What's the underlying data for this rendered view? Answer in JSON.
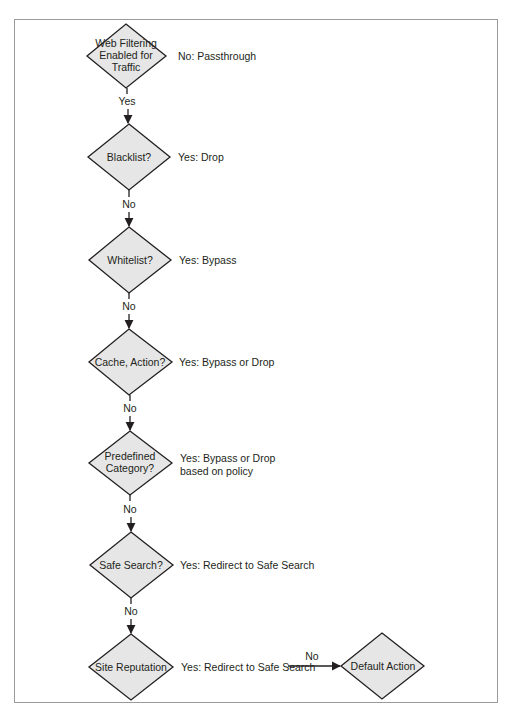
{
  "diagram": {
    "type": "flowchart",
    "colors": {
      "node_fill": "#e6e6e6",
      "stroke": "#231f20",
      "text": "#231f20",
      "frame": "#9a9a9a"
    },
    "nodes": [
      {
        "id": "web-filtering",
        "lines": [
          "Web Filtering",
          "Enabled for",
          "Traffic"
        ],
        "side_label": [
          "No: Passthrough"
        ]
      },
      {
        "id": "blacklist",
        "lines": [
          "Blacklist?"
        ],
        "side_label": [
          "Yes: Drop"
        ]
      },
      {
        "id": "whitelist",
        "lines": [
          "Whitelist?"
        ],
        "side_label": [
          "Yes: Bypass"
        ]
      },
      {
        "id": "cache-action",
        "lines": [
          "Cache, Action?"
        ],
        "side_label": [
          "Yes: Bypass or Drop"
        ]
      },
      {
        "id": "predefined-category",
        "lines": [
          "Predefined",
          "Category?"
        ],
        "side_label": [
          "Yes: Bypass or Drop",
          "based on policy"
        ]
      },
      {
        "id": "safe-search",
        "lines": [
          "Safe Search?"
        ],
        "side_label": [
          "Yes: Redirect to Safe Search"
        ]
      },
      {
        "id": "site-reputation",
        "lines": [
          "Site Reputation"
        ],
        "side_label": [
          "Yes: Redirect to Safe Search"
        ]
      },
      {
        "id": "default-action",
        "lines": [
          "Default Action"
        ],
        "side_label": []
      }
    ],
    "edges": [
      {
        "from": "web-filtering",
        "to": "blacklist",
        "label": "Yes"
      },
      {
        "from": "blacklist",
        "to": "whitelist",
        "label": "No"
      },
      {
        "from": "whitelist",
        "to": "cache-action",
        "label": "No"
      },
      {
        "from": "cache-action",
        "to": "predefined-category",
        "label": "No"
      },
      {
        "from": "predefined-category",
        "to": "safe-search",
        "label": "No"
      },
      {
        "from": "safe-search",
        "to": "site-reputation",
        "label": "No"
      },
      {
        "from": "site-reputation",
        "to": "default-action",
        "label": "No"
      }
    ]
  }
}
